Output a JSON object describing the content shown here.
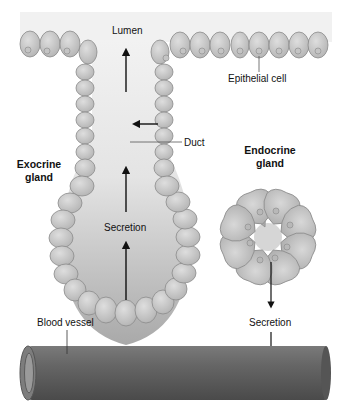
{
  "diagram": {
    "type": "biology-illustration",
    "labels": {
      "lumen": "Lumen",
      "epithelial_cell": "Epithelial cell",
      "duct": "Duct",
      "exocrine_line1": "Exocrine",
      "exocrine_line2": "gland",
      "endocrine_line1": "Endocrine",
      "endocrine_line2": "gland",
      "secretion_exocrine": "Secretion",
      "secretion_endocrine": "Secretion",
      "blood_vessel": "Blood vessel"
    },
    "colors": {
      "cell_fill": "#c9c9c9",
      "cell_stroke": "#8a8a8a",
      "lumen_light": "#f0f0f0",
      "lumen_dark": "#a8a8a8",
      "vessel": "#5e5e5e",
      "arrow": "#111111"
    }
  }
}
